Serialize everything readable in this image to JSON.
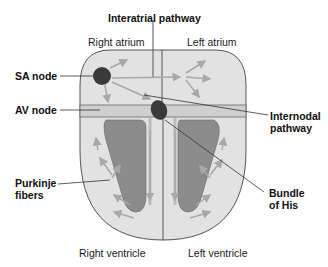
{
  "diagram": {
    "labels": {
      "interatrial_pathway": "Interatrial pathway",
      "right_atrium": "Right atrium",
      "left_atrium": "Left atrium",
      "sa_node": "SA node",
      "av_node": "AV node",
      "internodal_pathway_line1": "Internodal",
      "internodal_pathway_line2": "pathway",
      "purkinje_fibers_line1": "Purkinje",
      "purkinje_fibers_line2": "fibers",
      "bundle_of_his_line1": "Bundle",
      "bundle_of_his_line2": "of His",
      "right_ventricle": "Right ventricle",
      "left_ventricle": "Left ventricle"
    },
    "colors": {
      "heart_fill": "#e2e2e2",
      "chamber_fill": "#8c8c8c",
      "node_fill": "#3a3a3a",
      "arrow": "#a8a8a8",
      "outline": "#555555"
    }
  }
}
